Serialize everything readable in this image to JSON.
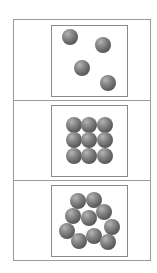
{
  "figure": {
    "panels": [
      {
        "label": "panel-1",
        "arrangement": "scattered",
        "count": 4,
        "box": {
          "top": 25,
          "bottom": 97
        },
        "balls": [
          [
            70,
            37
          ],
          [
            103,
            45
          ],
          [
            82,
            68
          ],
          [
            108,
            83
          ]
        ]
      },
      {
        "label": "panel-2",
        "arrangement": "ordered-grid-3x3",
        "count": 9,
        "box": {
          "top": 105,
          "bottom": 177
        },
        "balls": [
          [
            74,
            125
          ],
          [
            89,
            125
          ],
          [
            105,
            125
          ],
          [
            74,
            140
          ],
          [
            89,
            140
          ],
          [
            105,
            140
          ],
          [
            74,
            156
          ],
          [
            89,
            156
          ],
          [
            105,
            156
          ]
        ]
      },
      {
        "label": "panel-3",
        "arrangement": "clustered-disordered",
        "count": 10,
        "box": {
          "top": 185,
          "bottom": 257
        },
        "balls": [
          [
            78,
            201
          ],
          [
            94,
            200
          ],
          [
            73,
            216
          ],
          [
            89,
            218
          ],
          [
            104,
            212
          ],
          [
            67,
            231
          ],
          [
            112,
            227
          ],
          [
            79,
            241
          ],
          [
            94,
            236
          ],
          [
            108,
            242
          ]
        ]
      }
    ],
    "separators": [
      100,
      180
    ],
    "colors": {
      "border": "#9a9a9a",
      "ball_light": "#b4b4b4",
      "ball_dark": "#3e3e3e"
    }
  }
}
